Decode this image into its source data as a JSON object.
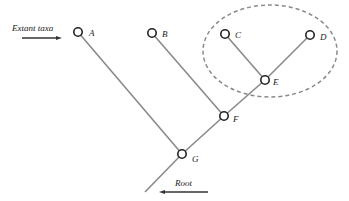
{
  "diagram": {
    "type": "phylogenetic-tree",
    "captions": {
      "extant": "Extant taxa",
      "root": "Root"
    },
    "nodes": [
      {
        "id": "A",
        "label": "A",
        "x": 78,
        "y": 32,
        "kind": "leaf"
      },
      {
        "id": "B",
        "label": "B",
        "x": 152,
        "y": 33,
        "kind": "leaf"
      },
      {
        "id": "C",
        "label": "C",
        "x": 225,
        "y": 34,
        "kind": "leaf"
      },
      {
        "id": "D",
        "label": "D",
        "x": 310,
        "y": 35,
        "kind": "leaf"
      },
      {
        "id": "E",
        "label": "E",
        "x": 265,
        "y": 80,
        "kind": "internal"
      },
      {
        "id": "F",
        "label": "F",
        "x": 224,
        "y": 116,
        "kind": "internal"
      },
      {
        "id": "G",
        "label": "G",
        "x": 182,
        "y": 154,
        "kind": "internal"
      }
    ],
    "edges": [
      [
        "C",
        "E"
      ],
      [
        "D",
        "E"
      ],
      [
        "E",
        "F"
      ],
      [
        "B",
        "F"
      ],
      [
        "F",
        "G"
      ],
      [
        "A",
        "G"
      ],
      [
        "G",
        "root"
      ]
    ],
    "highlighted_clade": [
      "C",
      "D",
      "E"
    ],
    "colors": {
      "branch": "#8a8a8a",
      "node_stroke": "#222222",
      "clade_outline": "#8a8a8a"
    }
  }
}
